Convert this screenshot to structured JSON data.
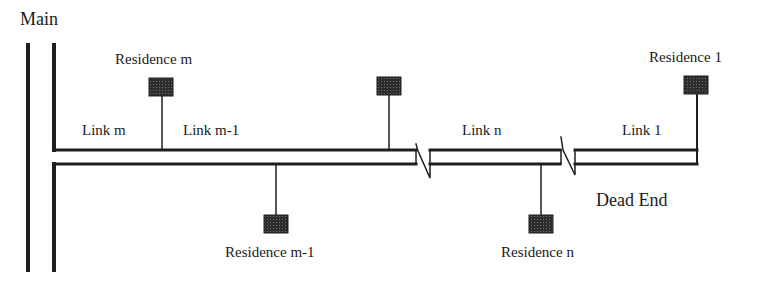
{
  "diagram": {
    "title": "Main",
    "colors": {
      "line": "#1f1f1f",
      "residence_fill": "#3a3a3a",
      "background": "#ffffff"
    },
    "labels": {
      "main": "Main",
      "dead_end": "Dead End"
    },
    "links": [
      {
        "id": "link-m",
        "label": "Link m"
      },
      {
        "id": "link-m-1",
        "label": "Link m-1"
      },
      {
        "id": "link-n",
        "label": "Link n"
      },
      {
        "id": "link-1",
        "label": "Link 1"
      }
    ],
    "residences": [
      {
        "id": "residence-m",
        "label": "Residence m",
        "side": "top"
      },
      {
        "id": "residence-unlabeled",
        "label": "",
        "side": "top"
      },
      {
        "id": "residence-1",
        "label": "Residence 1",
        "side": "top"
      },
      {
        "id": "residence-m-1",
        "label": "Residence m-1",
        "side": "bottom"
      },
      {
        "id": "residence-n",
        "label": "Residence n",
        "side": "bottom"
      }
    ]
  }
}
